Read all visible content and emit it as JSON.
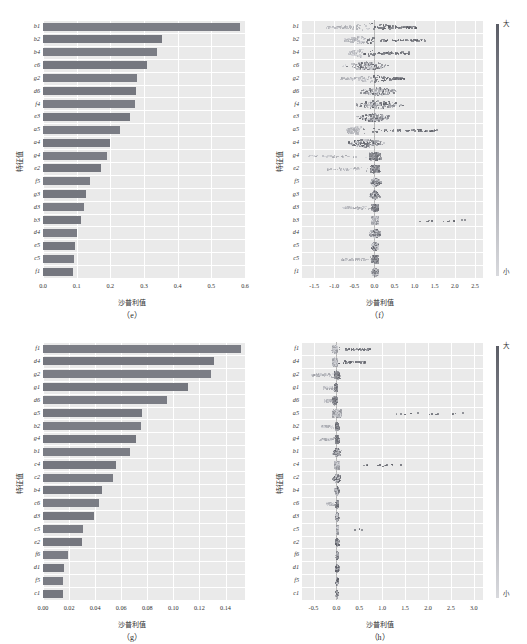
{
  "figure": {
    "title": "",
    "axis_labels": {
      "x": "沙普利值",
      "y": "特征值"
    },
    "colorbar": {
      "high": "大",
      "low": "小"
    }
  },
  "panels": [
    {
      "id": "e",
      "caption": "（e）"
    },
    {
      "id": "f",
      "caption": "（f）"
    },
    {
      "id": "g",
      "caption": "（g）"
    },
    {
      "id": "h",
      "caption": "（h）"
    }
  ],
  "chart_data": [
    {
      "panel": "e",
      "type": "bar",
      "orientation": "horizontal",
      "title": "（e）",
      "xlabel": "沙普利值",
      "ylabel": "特征值",
      "xlim": [
        0,
        0.6
      ],
      "xticks": [
        "0.0",
        "0.1",
        "0.2",
        "0.3",
        "0.4",
        "0.5",
        "0.6"
      ],
      "xtick_values": [
        0.0,
        0.1,
        0.2,
        0.3,
        0.4,
        0.5,
        0.6
      ],
      "grid": true,
      "legend": "none",
      "categories": [
        "b1",
        "b2",
        "b4",
        "c6",
        "g2",
        "d6",
        "f4",
        "e3",
        "a5",
        "a4",
        "g4",
        "e2",
        "f5",
        "g3",
        "d3",
        "b3",
        "d4",
        "e5",
        "c5",
        "f1"
      ],
      "values": [
        0.585,
        0.352,
        0.338,
        0.31,
        0.279,
        0.276,
        0.272,
        0.258,
        0.229,
        0.199,
        0.191,
        0.172,
        0.139,
        0.128,
        0.122,
        0.114,
        0.101,
        0.095,
        0.092,
        0.089
      ]
    },
    {
      "panel": "f",
      "type": "scatter",
      "plot_style": "beeswarm",
      "title": "（f）",
      "xlabel": "沙普利值",
      "ylabel": "特征值",
      "xlim": [
        -1.8,
        2.7
      ],
      "xticks": [
        "-1.5",
        "-1.0",
        "-0.5",
        "0.0",
        "0.5",
        "1.0",
        "1.5",
        "2.0",
        "2.5"
      ],
      "xtick_values": [
        -1.5,
        -1.0,
        -0.5,
        0.0,
        0.5,
        1.0,
        1.5,
        2.0,
        2.5
      ],
      "grid": true,
      "colorbar": {
        "high": "大",
        "low": "小",
        "position": "right"
      },
      "categories": [
        "b1",
        "b2",
        "b4",
        "c6",
        "g2",
        "d6",
        "f4",
        "e3",
        "a5",
        "a4",
        "g4",
        "e2",
        "f5",
        "g3",
        "d3",
        "b3",
        "d4",
        "e5",
        "c5",
        "f1"
      ],
      "series": [
        {
          "name": "b1",
          "spread": [
            -1.25,
            1.05
          ],
          "center": -0.1,
          "density": "bimodal"
        },
        {
          "name": "b2",
          "spread": [
            -0.75,
            1.25
          ],
          "center": -0.25,
          "density": "bimodal"
        },
        {
          "name": "b4",
          "spread": [
            -0.65,
            0.85
          ],
          "center": -0.3,
          "density": "bimodal"
        },
        {
          "name": "c6",
          "spread": [
            -1.4,
            0.9
          ],
          "center": -0.2,
          "density": "wide"
        },
        {
          "name": "g2",
          "spread": [
            -0.85,
            0.75
          ],
          "center": -0.05,
          "density": "bimodal"
        },
        {
          "name": "d6",
          "spread": [
            -1.3,
            0.7
          ],
          "center": 0.05,
          "density": "wide"
        },
        {
          "name": "f4",
          "spread": [
            -1.7,
            0.85
          ],
          "center": 0.05,
          "density": "wide"
        },
        {
          "name": "e3",
          "spread": [
            -1.05,
            0.8
          ],
          "center": 0.0,
          "density": "wide"
        },
        {
          "name": "a5",
          "spread": [
            -0.7,
            1.55
          ],
          "center": -0.35,
          "density": "bimodal"
        },
        {
          "name": "a4",
          "spread": [
            -1.1,
            0.8
          ],
          "center": -0.25,
          "density": "wide"
        },
        {
          "name": "g4",
          "spread": [
            -1.65,
            0.15
          ],
          "center": 0.0,
          "density": "left"
        },
        {
          "name": "e2",
          "spread": [
            -1.2,
            0.25
          ],
          "center": 0.0,
          "density": "left"
        },
        {
          "name": "f5",
          "spread": [
            -0.35,
            0.45
          ],
          "center": 0.0,
          "density": "narrow"
        },
        {
          "name": "g3",
          "spread": [
            -0.3,
            0.45
          ],
          "center": 0.0,
          "density": "narrow"
        },
        {
          "name": "d3",
          "spread": [
            -0.8,
            0.3
          ],
          "center": 0.0,
          "density": "left"
        },
        {
          "name": "b3",
          "spread": [
            -0.2,
            2.55
          ],
          "center": 0.0,
          "density": "outliers"
        },
        {
          "name": "d4",
          "spread": [
            -0.25,
            0.55
          ],
          "center": 0.0,
          "density": "narrow"
        },
        {
          "name": "e5",
          "spread": [
            -0.25,
            0.3
          ],
          "center": 0.0,
          "density": "narrow"
        },
        {
          "name": "c5",
          "spread": [
            -0.85,
            0.15
          ],
          "center": 0.0,
          "density": "left"
        },
        {
          "name": "f1",
          "spread": [
            -0.25,
            0.25
          ],
          "center": 0.0,
          "density": "narrow"
        }
      ]
    },
    {
      "panel": "g",
      "type": "bar",
      "orientation": "horizontal",
      "title": "（g）",
      "xlabel": "沙普利值",
      "ylabel": "特征值",
      "xlim": [
        0,
        0.155
      ],
      "xticks": [
        "0.00",
        "0.02",
        "0.04",
        "0.06",
        "0.08",
        "0.10",
        "0.12",
        "0.14"
      ],
      "xtick_values": [
        0.0,
        0.02,
        0.04,
        0.06,
        0.08,
        0.1,
        0.12,
        0.14
      ],
      "grid": true,
      "legend": "none",
      "categories": [
        "f1",
        "d4",
        "g2",
        "g1",
        "d6",
        "a5",
        "b2",
        "g4",
        "b1",
        "c4",
        "c2",
        "b4",
        "c6",
        "d3",
        "c5",
        "e2",
        "f6",
        "d1",
        "f5",
        "c1"
      ],
      "values": [
        0.152,
        0.131,
        0.129,
        0.111,
        0.095,
        0.076,
        0.075,
        0.071,
        0.067,
        0.056,
        0.054,
        0.045,
        0.043,
        0.039,
        0.031,
        0.03,
        0.019,
        0.016,
        0.015,
        0.015
      ]
    },
    {
      "panel": "h",
      "type": "scatter",
      "plot_style": "beeswarm",
      "title": "（h）",
      "xlabel": "沙普利值",
      "ylabel": "特征值",
      "xlim": [
        -0.75,
        3.2
      ],
      "xticks": [
        "-0.5",
        "0.0",
        "0.5",
        "1.0",
        "1.5",
        "2.0",
        "2.5",
        "3.0"
      ],
      "xtick_values": [
        -0.5,
        0.0,
        0.5,
        1.0,
        1.5,
        2.0,
        2.5,
        3.0
      ],
      "grid": true,
      "colorbar": {
        "high": "大",
        "low": "小",
        "position": "right"
      },
      "categories": [
        "f1",
        "d4",
        "g2",
        "g1",
        "d6",
        "a5",
        "b2",
        "g4",
        "b1",
        "c4",
        "c2",
        "b4",
        "c6",
        "d3",
        "c5",
        "e2",
        "f6",
        "d1",
        "f5",
        "c1"
      ],
      "series": [
        {
          "name": "f1",
          "spread": [
            -0.12,
            0.72
          ],
          "center": -0.05,
          "density": "right"
        },
        {
          "name": "d4",
          "spread": [
            -0.15,
            0.62
          ],
          "center": -0.05,
          "density": "right"
        },
        {
          "name": "g2",
          "spread": [
            -0.55,
            0.22
          ],
          "center": 0.0,
          "density": "left"
        },
        {
          "name": "g1",
          "spread": [
            -0.3,
            0.08
          ],
          "center": -0.02,
          "density": "left"
        },
        {
          "name": "d6",
          "spread": [
            -0.28,
            0.3
          ],
          "center": -0.05,
          "density": "left"
        },
        {
          "name": "a5",
          "spread": [
            -0.32,
            3.02
          ],
          "center": 0.0,
          "density": "outliers"
        },
        {
          "name": "b2",
          "spread": [
            -0.35,
            0.12
          ],
          "center": 0.0,
          "density": "left"
        },
        {
          "name": "g4",
          "spread": [
            -0.38,
            0.1
          ],
          "center": 0.0,
          "density": "left"
        },
        {
          "name": "b1",
          "spread": [
            -0.22,
            0.28
          ],
          "center": 0.0,
          "density": "narrow"
        },
        {
          "name": "c4",
          "spread": [
            -0.1,
            1.55
          ],
          "center": 0.0,
          "density": "outliers"
        },
        {
          "name": "c2",
          "spread": [
            -0.3,
            0.22
          ],
          "center": 0.0,
          "density": "narrow"
        },
        {
          "name": "b4",
          "spread": [
            -0.15,
            0.12
          ],
          "center": 0.0,
          "density": "narrow"
        },
        {
          "name": "c6",
          "spread": [
            -0.22,
            0.06
          ],
          "center": 0.0,
          "density": "left"
        },
        {
          "name": "d3",
          "spread": [
            -0.12,
            0.06
          ],
          "center": 0.0,
          "density": "narrow"
        },
        {
          "name": "c5",
          "spread": [
            -0.1,
            0.55
          ],
          "center": 0.0,
          "density": "outliers"
        },
        {
          "name": "e2",
          "spread": [
            -0.18,
            0.06
          ],
          "center": 0.0,
          "density": "narrow"
        },
        {
          "name": "f6",
          "spread": [
            -0.08,
            0.06
          ],
          "center": 0.0,
          "density": "narrow"
        },
        {
          "name": "d1",
          "spread": [
            -0.08,
            0.14
          ],
          "center": 0.0,
          "density": "narrow"
        },
        {
          "name": "f5",
          "spread": [
            -0.06,
            0.06
          ],
          "center": 0.0,
          "density": "narrow"
        },
        {
          "name": "c1",
          "spread": [
            -0.08,
            0.05
          ],
          "center": 0.0,
          "density": "narrow"
        }
      ]
    }
  ]
}
